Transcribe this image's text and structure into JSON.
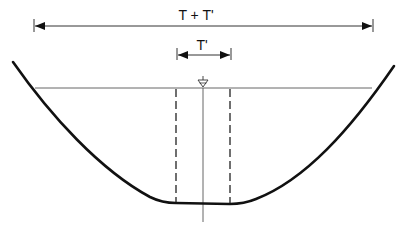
{
  "diagram": {
    "labels": {
      "total_width": "T + T'",
      "partial_width": "T'"
    },
    "symbols": {
      "water_surface": "water-surface-triangle-icon"
    },
    "elements": [
      {
        "id": "total-width-dimension",
        "label": "T + T'",
        "type": "double-arrow"
      },
      {
        "id": "partial-width-dimension",
        "label": "T'",
        "type": "double-arrow"
      },
      {
        "id": "water-surface-line",
        "type": "horizontal-line"
      },
      {
        "id": "channel-boundary",
        "type": "curve"
      },
      {
        "id": "centerline",
        "type": "vertical-line"
      },
      {
        "id": "dashed-boundary-left",
        "type": "dashed-vertical-line"
      },
      {
        "id": "dashed-boundary-right",
        "type": "dashed-vertical-line"
      }
    ],
    "colors": {
      "stroke": "#111111",
      "thin_stroke": "#555555",
      "background": "#ffffff"
    }
  }
}
